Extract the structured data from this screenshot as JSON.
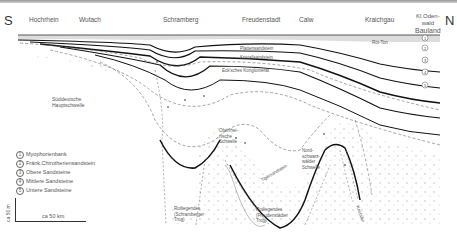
{
  "figure": {
    "directions": {
      "south": "S",
      "north": "N"
    },
    "locations": [
      {
        "label": "Hochrhein",
        "x": 30
      },
      {
        "label": "Wutach",
        "x": 80
      },
      {
        "label": "Schramberg",
        "x": 165
      },
      {
        "label": "Freudenstadt",
        "x": 243
      },
      {
        "label": "Calw",
        "x": 300
      },
      {
        "label": "Kraichgau",
        "x": 364
      }
    ],
    "location_multiline": {
      "line1": "Kl.Oden-",
      "line2": "wald",
      "line3": "Bauland"
    },
    "annotations": {
      "sueddeutsche_hauptschwelle_1": "Süddeutsche",
      "sueddeutsche_hauptschwelle_2": "Hauptschwelle",
      "oberrheinische_1": "Oberrhei-",
      "oberrheinische_2": "nische",
      "oberrheinische_3": "Schwelle",
      "nordschwarzwald_1": "Nord-",
      "nordschwarzwald_2": "schwarz-",
      "nordschwarzwald_3": "wälder",
      "nordschwarzwald_4": "Schwelle",
      "rotliegendes_schramberg_1": "Rotliegendes",
      "rotliegendes_schramberg_2": "(Schramberger",
      "rotliegendes_schramberg_3": "Trog)",
      "rotliegendes_freudenstadt_1": "Rotliegendes",
      "rotliegendes_freudenstadt_2": "(Freudenstädter",
      "rotliegendes_freudenstadt_3": "Trog)",
      "kristallin": "Kristallin",
      "layer_roet": "Röt",
      "layer_plattensandstein": "Plattensandstein",
      "layer_kristallsandstein": "Kristallsandstein",
      "layer_ecksches_konglomerat": "Eck'sches Konglomerat",
      "layer_tigersandstein": "Tigersandstein",
      "layer_roet_ton": "Röt-Ton"
    },
    "legend": [
      {
        "num": "1",
        "label": "Myophorienbank"
      },
      {
        "num": "2",
        "label": "Fränk.Chirotheriensandstein"
      },
      {
        "num": "3",
        "label": "Obere Sandsteine"
      },
      {
        "num": "4",
        "label": "Mittlere Sandsteine"
      },
      {
        "num": "5",
        "label": "Untere Sandsteine"
      }
    ],
    "scale": {
      "vertical": "ca 50 m",
      "horizontal": "ca 50 km"
    },
    "colors": {
      "line": "#222222",
      "dashed": "#666666",
      "dots": "#999999",
      "hatch": "#888888"
    }
  }
}
